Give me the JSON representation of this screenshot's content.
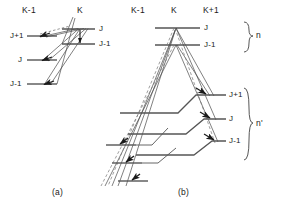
{
  "figure": {
    "columns_panel_a": [
      {
        "id": "a-col-k-minus-1",
        "label": "K-1",
        "x": 22
      },
      {
        "id": "a-col-k",
        "label": "K",
        "x": 77
      }
    ],
    "columns_panel_b": [
      {
        "id": "b-col-k-minus-1",
        "label": "K-1",
        "x": 131
      },
      {
        "id": "b-col-k",
        "label": "K",
        "x": 171
      },
      {
        "id": "b-col-k-plus-1",
        "label": "K+1",
        "x": 203
      }
    ],
    "panel_captions": [
      {
        "id": "caption-a",
        "label": "(a)",
        "x": 52,
        "y": 188
      },
      {
        "id": "caption-b",
        "label": "(b)",
        "x": 178,
        "y": 188
      }
    ],
    "panel_a": {
      "left_levels": [
        {
          "id": "a-left-j-plus-1",
          "label": "J+1",
          "label_x": 14,
          "label_y": 32,
          "y": 36,
          "x1": 27,
          "x2": 57
        },
        {
          "id": "a-left-j",
          "label": "J",
          "label_x": 20,
          "label_y": 56,
          "y": 60,
          "x1": 27,
          "x2": 57
        },
        {
          "id": "a-left-j-minus-1",
          "label": "J-1",
          "label_x": 14,
          "label_y": 80,
          "y": 84,
          "x1": 27,
          "x2": 57
        }
      ],
      "right_levels": [
        {
          "id": "a-right-j",
          "label": "J",
          "label_x": 100,
          "label_y": 25,
          "y": 29,
          "x1": 62,
          "x2": 95
        },
        {
          "id": "a-right-j-minus-1",
          "label": "J-1",
          "label_x": 100,
          "label_y": 40,
          "y": 44,
          "x1": 62,
          "x2": 95
        }
      ],
      "vertical_transition": {
        "id": "a-vertical-arrow",
        "x": 80,
        "y1": 30,
        "y2": 43
      },
      "transitions": [
        {
          "id": "a-trans-1",
          "from_x": 57,
          "from_y": 36,
          "to_x": 78,
          "to_y": 29,
          "dashed": false
        },
        {
          "id": "a-trans-2",
          "from_x": 57,
          "from_y": 60,
          "to_x": 78,
          "to_y": 29,
          "dashed": false
        },
        {
          "id": "a-trans-3",
          "from_x": 57,
          "from_y": 84,
          "to_x": 78,
          "to_y": 29,
          "dashed": false
        },
        {
          "id": "a-trans-4",
          "from_x": 42,
          "from_y": 36,
          "to_x": 64,
          "to_y": 20,
          "dashed": true
        }
      ],
      "incoming_arrows": [
        {
          "id": "a-arrow-j-plus-1",
          "x": 45,
          "y": 36
        },
        {
          "id": "a-arrow-j",
          "x": 45,
          "y": 60
        },
        {
          "id": "a-arrow-j-minus-1",
          "x": 45,
          "y": 84
        }
      ]
    },
    "panel_b": {
      "upper_levels": [
        {
          "id": "b-upper-j",
          "label": "J",
          "label_x": 205,
          "label_y": 24,
          "y": 28,
          "x1": 155,
          "x2": 200
        },
        {
          "id": "b-upper-j-minus-1",
          "label": "J-1",
          "label_x": 205,
          "label_y": 41,
          "y": 45,
          "x1": 155,
          "x2": 200
        }
      ],
      "lower_right_levels": [
        {
          "id": "b-lower-j-plus-1",
          "label": "J+1",
          "label_x": 228,
          "label_y": 91,
          "y": 95
        },
        {
          "id": "b-lower-j",
          "label": "J",
          "label_x": 228,
          "label_y": 115,
          "y": 119
        },
        {
          "id": "b-lower-j-minus-1",
          "label": "J-1",
          "label_x": 228,
          "label_y": 137,
          "y": 141
        }
      ],
      "lower_left_levels": [
        {
          "id": "b-lower-left-1",
          "y": 145
        },
        {
          "id": "b-lower-left-2",
          "y": 163
        },
        {
          "id": "b-lower-left-3",
          "y": 181
        }
      ],
      "braces": [
        {
          "id": "brace-upper",
          "label": "n",
          "label_x": 259,
          "label_y": 33,
          "y1": 22,
          "y2": 52,
          "x": 248
        },
        {
          "id": "brace-lower",
          "label": "n'",
          "label_x": 259,
          "label_y": 122,
          "y1": 88,
          "y2": 160,
          "x": 248
        }
      ]
    },
    "style": {
      "line_color": "#2b2b2b",
      "level_color": "#555555",
      "text_color": "#1a1a1a",
      "background": "#ffffff"
    }
  }
}
